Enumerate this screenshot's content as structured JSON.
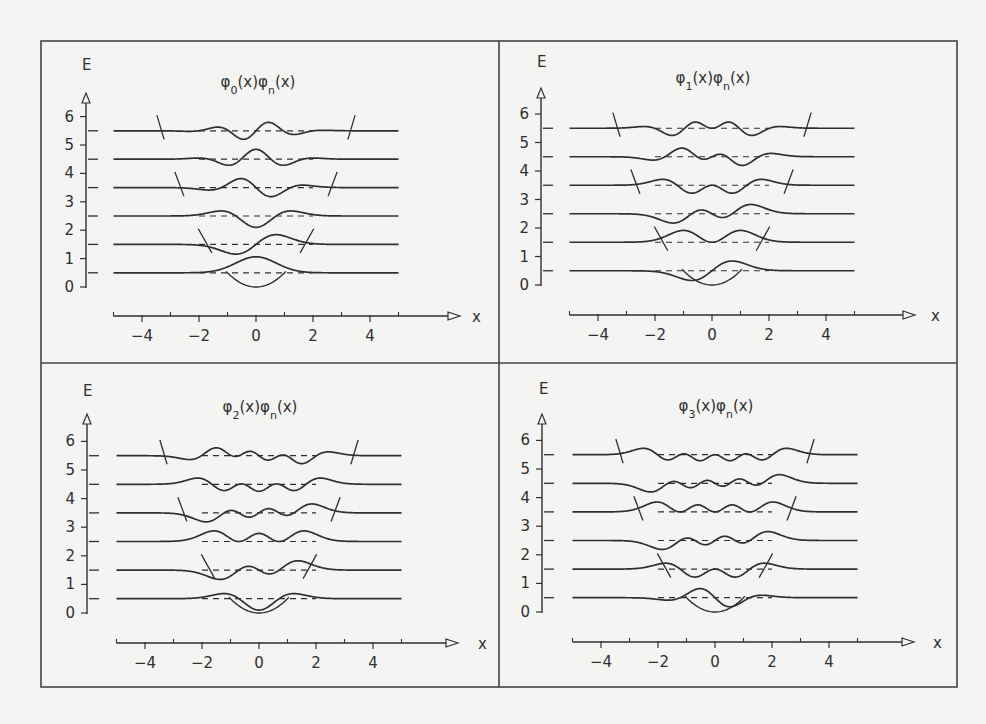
{
  "figure": {
    "background": "#f4f4f2",
    "ink": "#2f2f2f",
    "frame": {
      "x0": 41,
      "y0": 41,
      "x1": 957,
      "y1": 687,
      "split_x": 499,
      "split_y": 363
    }
  },
  "chart_data": [
    {
      "type": "line",
      "title": "φ0(x)φn(x)",
      "title_parts": {
        "a": "φ",
        "a_sub": "0",
        "b": "(x)φ",
        "b_sub": "n",
        "c": "(x)"
      },
      "m": 0,
      "xlabel": "x",
      "ylabel": "E",
      "xlim": [
        -5,
        5
      ],
      "ylim": [
        0,
        6
      ],
      "xticks_major": [
        -4,
        -2,
        0,
        2,
        4
      ],
      "xticks_minor": [
        -5,
        -3,
        -1,
        1,
        3,
        5
      ],
      "yticks": [
        0,
        1,
        2,
        3,
        4,
        5,
        6
      ],
      "levels": [
        0.5,
        1.5,
        2.5,
        3.5,
        4.5,
        5.5
      ],
      "series": [
        {
          "name": "n=0",
          "baseline": 0.5,
          "function": "ψ0(x)ψ0(x) + 0.5"
        },
        {
          "name": "n=1",
          "baseline": 1.5,
          "function": "ψ0(x)ψ1(x) + 1.5"
        },
        {
          "name": "n=2",
          "baseline": 2.5,
          "function": "ψ0(x)ψ2(x) + 2.5"
        },
        {
          "name": "n=3",
          "baseline": 3.5,
          "function": "ψ0(x)ψ3(x) + 3.5"
        },
        {
          "name": "n=4",
          "baseline": 4.5,
          "function": "ψ0(x)ψ4(x) + 4.5"
        },
        {
          "name": "n=5",
          "baseline": 5.5,
          "function": "ψ0(x)ψ5(x) + 5.5"
        }
      ],
      "potential": {
        "function": "V(x) = x²/2",
        "turning_point_marks_at": [
          1.5,
          3.5,
          5.5
        ]
      },
      "layout": {
        "ox": 256,
        "oy": 287,
        "sx": 28.5,
        "sy": 28.4,
        "title_x": 258,
        "title_y": 87,
        "e_label_x": 82,
        "e_label_y": 70,
        "xaxis_y": 316,
        "yaxis_x": 86,
        "arrow_x": 460,
        "arrow_y": 93,
        "x_label_x": 472
      }
    },
    {
      "type": "line",
      "title": "φ1(x)φn(x)",
      "title_parts": {
        "a": "φ",
        "a_sub": "1",
        "b": "(x)φ",
        "b_sub": "n",
        "c": "(x)"
      },
      "m": 1,
      "xlabel": "x",
      "ylabel": "E",
      "xlim": [
        -5,
        5
      ],
      "ylim": [
        0,
        6
      ],
      "xticks_major": [
        -4,
        -2,
        0,
        2,
        4
      ],
      "xticks_minor": [
        -5,
        -3,
        -1,
        1,
        3,
        5
      ],
      "yticks": [
        0,
        1,
        2,
        3,
        4,
        5,
        6
      ],
      "levels": [
        0.5,
        1.5,
        2.5,
        3.5,
        4.5,
        5.5
      ],
      "series": [
        {
          "name": "n=0",
          "baseline": 0.5,
          "function": "ψ1(x)ψ0(x) + 0.5"
        },
        {
          "name": "n=1",
          "baseline": 1.5,
          "function": "ψ1(x)ψ1(x) + 1.5"
        },
        {
          "name": "n=2",
          "baseline": 2.5,
          "function": "ψ1(x)ψ2(x) + 2.5"
        },
        {
          "name": "n=3",
          "baseline": 3.5,
          "function": "ψ1(x)ψ3(x) + 3.5"
        },
        {
          "name": "n=4",
          "baseline": 4.5,
          "function": "ψ1(x)ψ4(x) + 4.5"
        },
        {
          "name": "n=5",
          "baseline": 5.5,
          "function": "ψ1(x)ψ5(x) + 5.5"
        }
      ],
      "potential": {
        "function": "V(x) = x²/2",
        "turning_point_marks_at": [
          1.5,
          3.5,
          5.5
        ]
      },
      "layout": {
        "ox": 712,
        "oy": 285,
        "sx": 28.5,
        "sy": 28.5,
        "title_x": 713,
        "title_y": 83,
        "e_label_x": 537,
        "e_label_y": 67,
        "xaxis_y": 315,
        "yaxis_x": 541,
        "arrow_x": 915,
        "arrow_y": 88,
        "x_label_x": 931
      }
    },
    {
      "type": "line",
      "title": "φ2(x)φn(x)",
      "title_parts": {
        "a": "φ",
        "a_sub": "2",
        "b": "(x)φ",
        "b_sub": "n",
        "c": "(x)"
      },
      "m": 2,
      "xlabel": "x",
      "ylabel": "E",
      "xlim": [
        -5,
        5
      ],
      "ylim": [
        0,
        6
      ],
      "xticks_major": [
        -4,
        -2,
        0,
        2,
        4
      ],
      "xticks_minor": [
        -5,
        -3,
        -1,
        1,
        3,
        5
      ],
      "yticks": [
        0,
        1,
        2,
        3,
        4,
        5,
        6
      ],
      "levels": [
        0.5,
        1.5,
        2.5,
        3.5,
        4.5,
        5.5
      ],
      "series": [
        {
          "name": "n=0",
          "baseline": 0.5,
          "function": "ψ2(x)ψ0(x) + 0.5"
        },
        {
          "name": "n=1",
          "baseline": 1.5,
          "function": "ψ2(x)ψ1(x) + 1.5"
        },
        {
          "name": "n=2",
          "baseline": 2.5,
          "function": "ψ2(x)ψ2(x) + 2.5"
        },
        {
          "name": "n=3",
          "baseline": 3.5,
          "function": "ψ2(x)ψ3(x) + 3.5"
        },
        {
          "name": "n=4",
          "baseline": 4.5,
          "function": "ψ2(x)ψ4(x) + 4.5"
        },
        {
          "name": "n=5",
          "baseline": 5.5,
          "function": "ψ2(x)ψ5(x) + 5.5"
        }
      ],
      "potential": {
        "function": "V(x) = x²/2",
        "turning_point_marks_at": [
          1.5,
          3.5,
          5.5
        ]
      },
      "layout": {
        "ox": 259,
        "oy": 613,
        "sx": 28.5,
        "sy": 28.6,
        "title_x": 260,
        "title_y": 412,
        "e_label_x": 83,
        "e_label_y": 396,
        "xaxis_y": 643,
        "yaxis_x": 87,
        "arrow_x": 458,
        "arrow_y": 414,
        "x_label_x": 478
      }
    },
    {
      "type": "line",
      "title": "φ3(x)φn(x)",
      "title_parts": {
        "a": "φ",
        "a_sub": "3",
        "b": "(x)φ",
        "b_sub": "n",
        "c": "(x)"
      },
      "m": 3,
      "xlabel": "x",
      "ylabel": "E",
      "xlim": [
        -5,
        5
      ],
      "ylim": [
        0,
        6
      ],
      "xticks_major": [
        -4,
        -2,
        0,
        2,
        4
      ],
      "xticks_minor": [
        -5,
        -3,
        -1,
        1,
        3,
        5
      ],
      "yticks": [
        0,
        1,
        2,
        3,
        4,
        5,
        6
      ],
      "levels": [
        0.5,
        1.5,
        2.5,
        3.5,
        4.5,
        5.5
      ],
      "series": [
        {
          "name": "n=0",
          "baseline": 0.5,
          "function": "ψ3(x)ψ0(x) + 0.5"
        },
        {
          "name": "n=1",
          "baseline": 1.5,
          "function": "ψ3(x)ψ1(x) + 1.5"
        },
        {
          "name": "n=2",
          "baseline": 2.5,
          "function": "ψ3(x)ψ2(x) + 2.5"
        },
        {
          "name": "n=3",
          "baseline": 3.5,
          "function": "ψ3(x)ψ3(x) + 3.5"
        },
        {
          "name": "n=4",
          "baseline": 4.5,
          "function": "ψ3(x)ψ4(x) + 4.5"
        },
        {
          "name": "n=5",
          "baseline": 5.5,
          "function": "ψ3(x)ψ5(x) + 5.5"
        }
      ],
      "potential": {
        "function": "V(x) = x²/2",
        "turning_point_marks_at": [
          1.5,
          3.5,
          5.5
        ]
      },
      "layout": {
        "ox": 715,
        "oy": 612,
        "sx": 28.5,
        "sy": 28.6,
        "title_x": 716,
        "title_y": 411,
        "e_label_x": 539,
        "e_label_y": 394,
        "xaxis_y": 642,
        "yaxis_x": 542,
        "arrow_x": 914,
        "arrow_y": 414,
        "x_label_x": 933
      }
    }
  ]
}
